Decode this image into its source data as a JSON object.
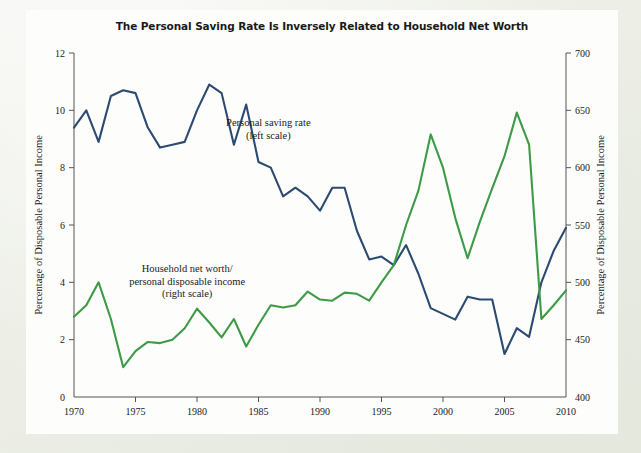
{
  "figure": {
    "title": "The Personal Saving Rate Is Inversely Related to Household Net Worth",
    "background_color": "#fdfdfb",
    "page_color": "#eceee6"
  },
  "chart_data": {
    "type": "line",
    "title": "The Personal Saving Rate Is Inversely Related to Household Net Worth",
    "xlabel": "",
    "ylabel": "Percentage of Disposable Personal Income",
    "y2label": "Percentage of Disposable Personal Income",
    "xlim": [
      1970,
      2010
    ],
    "ylim": [
      0,
      12
    ],
    "y2lim": [
      400,
      700
    ],
    "xticks": [
      1970,
      1975,
      1980,
      1985,
      1990,
      1995,
      2000,
      2005,
      2010
    ],
    "yticks": [
      0,
      2,
      4,
      6,
      8,
      10,
      12
    ],
    "y2ticks": [
      400,
      450,
      500,
      550,
      600,
      650,
      700
    ],
    "grid": false,
    "legend_position": "inline-annotations",
    "x": [
      1970,
      1971,
      1972,
      1973,
      1974,
      1975,
      1976,
      1977,
      1978,
      1979,
      1980,
      1981,
      1982,
      1983,
      1984,
      1985,
      1986,
      1987,
      1988,
      1989,
      1990,
      1991,
      1992,
      1993,
      1994,
      1995,
      1996,
      1997,
      1998,
      1999,
      2000,
      2001,
      2002,
      2003,
      2004,
      2005,
      2006,
      2007,
      2008,
      2009,
      2010
    ],
    "series": [
      {
        "name": "Personal saving rate",
        "axis": "left",
        "color": "#2c4a72",
        "annotation": "Personal saving rate\n(left scale)",
        "units": "percent of disposable personal income",
        "values": [
          9.4,
          10.0,
          8.9,
          10.5,
          10.7,
          10.6,
          9.4,
          8.7,
          8.8,
          8.9,
          10.0,
          10.9,
          10.6,
          8.8,
          10.2,
          8.2,
          8.0,
          7.0,
          7.3,
          7.0,
          6.5,
          7.3,
          7.3,
          5.8,
          4.8,
          4.9,
          4.6,
          5.3,
          4.3,
          3.1,
          2.9,
          2.7,
          3.5,
          3.4,
          3.4,
          1.5,
          2.4,
          2.1,
          4.0,
          5.1,
          5.9
        ]
      },
      {
        "name": "Household net worth/personal disposable income",
        "axis": "right",
        "color": "#3d9b47",
        "annotation": "Household net worth/\npersonal disposable income\n(right scale)",
        "units": "percent of disposable personal income",
        "values": [
          470,
          480,
          500,
          468,
          426,
          440,
          448,
          447,
          450,
          460,
          477,
          465,
          452,
          468,
          444,
          463,
          480,
          478,
          480,
          492,
          485,
          484,
          491,
          490,
          484,
          500,
          515,
          550,
          580,
          629,
          600,
          556,
          521,
          553,
          582,
          610,
          648,
          620,
          468,
          480,
          493
        ]
      }
    ],
    "annotations": [
      {
        "text_lines": [
          "Personal saving rate",
          "(left scale)"
        ],
        "x": 1985.8,
        "y": 9.45
      },
      {
        "text_lines": [
          "Household net worth/",
          "personal disposable income",
          "(right scale)"
        ],
        "x": 1979.2,
        "y": 4.35
      }
    ]
  }
}
